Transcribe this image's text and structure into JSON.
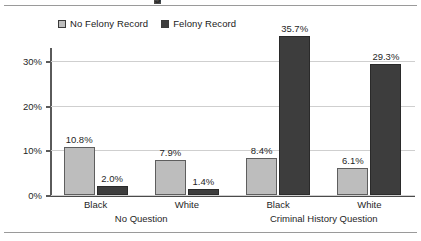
{
  "figure": {
    "title_cropped": "g",
    "legend": [
      {
        "label": "No Felony Record",
        "swatch": "light-gray-square",
        "color": "#bdbdbd"
      },
      {
        "label": "Felony Record",
        "swatch": "dark-gray-square",
        "color": "#3d3d3d"
      }
    ]
  },
  "chart_data": {
    "type": "bar",
    "title": "",
    "xlabel": "",
    "ylabel": "",
    "ylim": [
      0,
      33
    ],
    "yticks": [
      "0%",
      "10%",
      "20%",
      "30%"
    ],
    "ytick_values": [
      0,
      10,
      20,
      30
    ],
    "grid": true,
    "legend_position": "top-left",
    "categories": [
      "Black",
      "White",
      "Black",
      "White"
    ],
    "groups": [
      {
        "label": "No Question",
        "categories": [
          "Black",
          "White"
        ]
      },
      {
        "label": "Criminal History Question",
        "categories": [
          "Black",
          "White"
        ]
      }
    ],
    "series": [
      {
        "name": "No Felony Record",
        "color": "#bdbdbd",
        "values": [
          10.8,
          7.9,
          8.4,
          6.1
        ],
        "labels": [
          "10.8%",
          "7.9%",
          "8.4%",
          "6.1%"
        ]
      },
      {
        "name": "Felony Record",
        "color": "#3d3d3d",
        "values": [
          2.0,
          1.4,
          35.7,
          29.3
        ],
        "labels": [
          "2.0%",
          "1.4%",
          "35.7%",
          "29.3%"
        ]
      }
    ]
  }
}
